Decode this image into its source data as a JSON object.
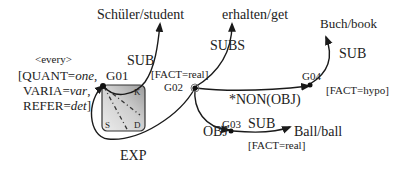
{
  "nodes": {
    "g01": {
      "id": "G01",
      "annotation_head": "<every>",
      "annotation_lines": [
        "[QUANT=",
        "one",
        ",",
        "VARIA=",
        "var",
        ",",
        "REFER=",
        "det",
        "]"
      ]
    },
    "g02": {
      "id": "G02",
      "fact": "[FACT=real]"
    },
    "g03": {
      "id": "G03",
      "fact": "[FACT=real]"
    },
    "g04": {
      "id": "G04",
      "fact": "[FACT=hypo]"
    }
  },
  "g01_annotation": {
    "every": "<every>",
    "quant_key": "[QUANT=",
    "quant_val": "one",
    "quant_sep": ",",
    "varia_key": "VARIA=",
    "varia_val": "var",
    "varia_sep": ",",
    "refer_key": "REFER=",
    "refer_val": "det",
    "refer_end": "]"
  },
  "box_corners": {
    "k": "K",
    "s": "S",
    "d": "D"
  },
  "concepts": {
    "student": "Schüler/student",
    "get": "erhalten/get",
    "book": "Buch/book",
    "ball": "Ball/ball"
  },
  "edges": {
    "g01_sub": "SUB",
    "g02_subs": "SUBS",
    "g02_g04": "*NON(OBJ)",
    "g04_sub": "SUB",
    "g02_g03": "OBJ",
    "g03_sub": "SUB",
    "g02_g01_exp": "EXP"
  }
}
